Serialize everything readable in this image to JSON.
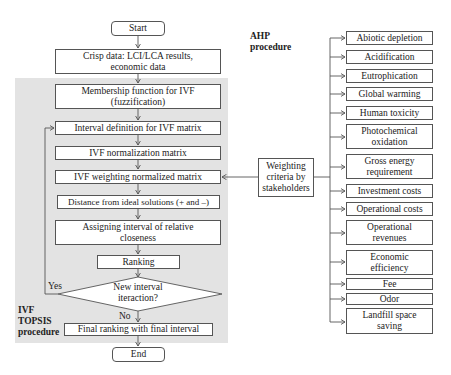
{
  "ivf_topsis": {
    "region_label_lines": [
      "IVF",
      "TOPSIS",
      "procedure"
    ],
    "steps": {
      "start": "Start",
      "crisp_data_line1": "Crisp data: LCI/LCA results,",
      "crisp_data_line2": "economic data",
      "membership_line1": "Membership function for IVF",
      "membership_line2": "(fuzzification)",
      "interval_definition": "Interval definition for IVF matrix",
      "normalization": "IVF normalization matrix",
      "weighting_normalized": "IVF weighting normalized matrix",
      "distance": "Distance from ideal solutions (+ and –)",
      "assigning_line1": "Assigning interval of relative",
      "assigning_line2": "closeness",
      "ranking": "Ranking",
      "decision_line1": "New interval",
      "decision_line2": "iteraction?",
      "yes_label": "Yes",
      "no_label": "No",
      "final_ranking": "Final ranking with final interval",
      "end": "End"
    }
  },
  "ahp": {
    "region_label_lines": [
      "AHP",
      "procedure"
    ],
    "weighting_box_lines": [
      "Weighting",
      "criteria by",
      "stakeholders"
    ],
    "criteria": [
      [
        "Abiotic depletion"
      ],
      [
        "Acidification"
      ],
      [
        "Eutrophication"
      ],
      [
        "Global warming"
      ],
      [
        "Human toxicity"
      ],
      [
        "Photochemical",
        "oxidation"
      ],
      [
        "Gross energy",
        "requirement"
      ],
      [
        "Investment costs"
      ],
      [
        "Operational costs"
      ],
      [
        "Operational",
        "revenues"
      ],
      [
        "Economic",
        "efficiency"
      ],
      [
        "Fee"
      ],
      [
        "Odor"
      ],
      [
        "Landfill space",
        "saving"
      ]
    ]
  },
  "colors": {
    "region_fill": "#e3e3e3",
    "line": "#555555",
    "box_fill": "#ffffff"
  }
}
